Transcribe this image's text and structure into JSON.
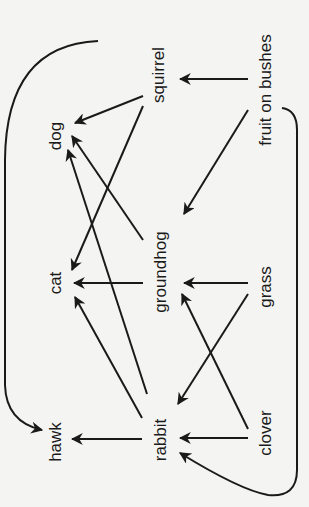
{
  "diagram": {
    "type": "food-web",
    "orientation": "rotated-90-ccw",
    "colors": {
      "line": "#1a1a1a",
      "background": "#f4f4f2"
    },
    "nodes": {
      "dog": {
        "label": "dog",
        "x": 55,
        "y": 136
      },
      "squirrel": {
        "label": "squirrel",
        "x": 158,
        "y": 75
      },
      "fruit": {
        "label": "fruit on bushes",
        "x": 265,
        "y": 90
      },
      "cat": {
        "label": "cat",
        "x": 55,
        "y": 283
      },
      "groundhog": {
        "label": "groundhog",
        "x": 160,
        "y": 272
      },
      "grass": {
        "label": "grass",
        "x": 265,
        "y": 287
      },
      "hawk": {
        "label": "hawk",
        "x": 55,
        "y": 442
      },
      "rabbit": {
        "label": "rabbit",
        "x": 160,
        "y": 440
      },
      "clover": {
        "label": "clover",
        "x": 265,
        "y": 433
      }
    },
    "edges": [
      {
        "from": "fruit on bushes",
        "to": "squirrel"
      },
      {
        "from": "fruit on bushes",
        "to": "groundhog"
      },
      {
        "from": "fruit on bushes",
        "to": "rabbit"
      },
      {
        "from": "squirrel",
        "to": "dog"
      },
      {
        "from": "squirrel",
        "to": "cat"
      },
      {
        "from": "squirrel",
        "to": "hawk"
      },
      {
        "from": "groundhog",
        "to": "dog"
      },
      {
        "from": "groundhog",
        "to": "cat"
      },
      {
        "from": "grass",
        "to": "groundhog"
      },
      {
        "from": "grass",
        "to": "rabbit"
      },
      {
        "from": "clover",
        "to": "groundhog"
      },
      {
        "from": "clover",
        "to": "rabbit"
      },
      {
        "from": "rabbit",
        "to": "dog"
      },
      {
        "from": "rabbit",
        "to": "cat"
      },
      {
        "from": "rabbit",
        "to": "hawk"
      }
    ]
  }
}
